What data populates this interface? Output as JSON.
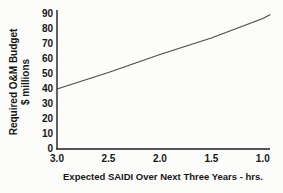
{
  "chart_data": {
    "type": "line",
    "title": "",
    "xlabel": "Expected SAIDI Over Next Three Years - hrs.",
    "ylabel": "Required O&M Budget $ millions",
    "ylabel_lines": [
      "Required O&M Budget",
      "$ millions"
    ],
    "x_tick_labels": [
      "3.0",
      "2.5",
      "2.0",
      "1.5",
      "1.0"
    ],
    "x_tick_values": [
      3.0,
      2.5,
      2.0,
      1.5,
      1.0
    ],
    "y_ticks": [
      0,
      10,
      20,
      30,
      40,
      50,
      60,
      70,
      80,
      90
    ],
    "x_axis_reversed": true,
    "xlim": [
      3.0,
      0.93
    ],
    "ylim": [
      0,
      90
    ],
    "grid": false,
    "legend": "none",
    "series": [
      {
        "name": "Required O&M Budget vs Expected SAIDI",
        "points": [
          [
            3.0,
            40
          ],
          [
            2.75,
            45.5
          ],
          [
            2.5,
            51
          ],
          [
            2.25,
            57
          ],
          [
            2.0,
            63
          ],
          [
            1.75,
            68.5
          ],
          [
            1.5,
            74
          ],
          [
            1.25,
            80.5
          ],
          [
            1.0,
            87
          ],
          [
            0.93,
            89.5
          ]
        ]
      }
    ],
    "line_color": "#4b4b4b",
    "axis_color": "#1f1f1f",
    "text_color": "#161616",
    "background_color": "#fcfcfa"
  }
}
